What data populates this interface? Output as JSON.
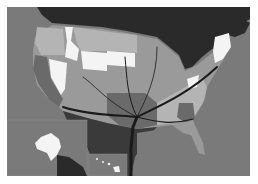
{
  "map": {
    "title": "United States flow map (grayscale choropleth)",
    "colors": {
      "ocean": "#7a7a7a",
      "canada": "#2a2a2a",
      "mexico": "#3a3a3a",
      "state_white": "#f4f4f4",
      "state_light": "#b4b4b4",
      "state_mid": "#9a9a9a",
      "state_dark": "#6a6a6a",
      "flow_lines": "#1a1a1a"
    },
    "insets": [
      "Alaska",
      "Hawaii"
    ]
  }
}
